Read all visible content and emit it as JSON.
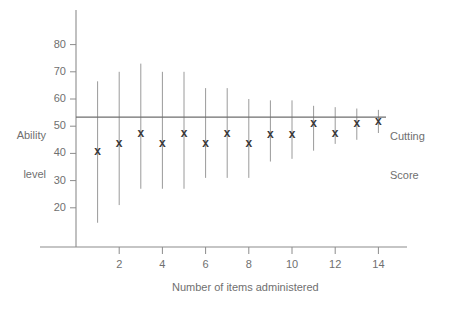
{
  "chart_data": {
    "type": "scatter",
    "title": "",
    "xlabel": "Number of items administered",
    "ylabel": "Ability\nlevel",
    "ylabel_lines": [
      "Ability",
      "level"
    ],
    "xlim": [
      0,
      15
    ],
    "ylim": [
      10,
      88
    ],
    "grid": false,
    "legend": null,
    "x": [
      1,
      2,
      3,
      4,
      5,
      6,
      7,
      8,
      9,
      10,
      11,
      12,
      13,
      14
    ],
    "categories": [
      "1",
      "2",
      "3",
      "4",
      "5",
      "6",
      "7",
      "8",
      "9",
      "10",
      "11",
      "12",
      "13",
      "14"
    ],
    "xticks": [
      2,
      4,
      6,
      8,
      10,
      12,
      14
    ],
    "xtick_labels": [
      "2",
      "4",
      "6",
      "8",
      "10",
      "12",
      "14"
    ],
    "yticks": [
      20,
      30,
      40,
      50,
      60,
      70,
      80
    ],
    "ytick_labels": [
      "20",
      "30",
      "40",
      "50",
      "60",
      "70",
      "80"
    ],
    "marker_symbol": "x",
    "series": [
      {
        "name": "Estimated ability",
        "values": [
          41,
          44,
          47.5,
          44,
          47.5,
          44,
          47.5,
          44,
          47,
          47,
          51,
          47.5,
          51,
          52
        ],
        "ci_low": [
          14.5,
          21,
          27,
          27,
          27,
          31,
          31,
          31,
          37,
          38,
          41,
          43.5,
          45,
          47.5
        ],
        "ci_high": [
          66.5,
          70,
          73,
          70,
          70,
          64,
          64,
          60,
          59.5,
          59.5,
          57.5,
          57,
          56.5,
          56
        ]
      }
    ],
    "reference_line": {
      "value": 53.3,
      "label_lines": [
        "Cutting",
        "Score"
      ],
      "label": "Cutting Score"
    }
  },
  "axes": {
    "y_axis_name": "ability-level-axis",
    "x_axis_name": "items-administered-axis"
  },
  "colors": {
    "axis": "#8c8c8c",
    "errorbar": "#9a9a9a",
    "marker": "#3a3a3a",
    "reference_line": "#6e6e6e",
    "text": "#6f6f6f"
  }
}
